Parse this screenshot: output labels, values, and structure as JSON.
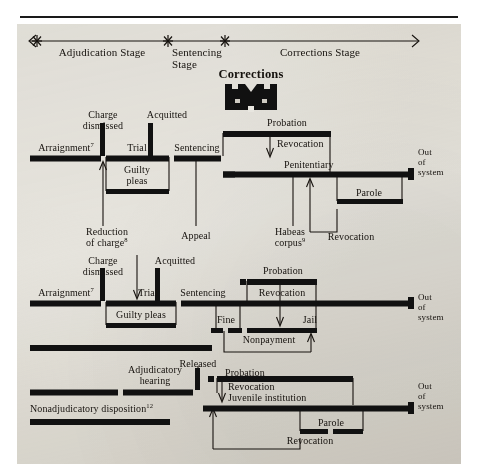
{
  "figure": {
    "icon_label": "Corrections",
    "icon_name": "fortress-corrections-icon",
    "colors": {
      "ink": "#16120e",
      "bar": "#111111",
      "paper": "#e8e6e0"
    }
  },
  "timeline": {
    "name": "stage-timeline",
    "stages": [
      {
        "label": "Adjudication Stage"
      },
      {
        "label": "Sentencing Stage"
      },
      {
        "label": "Corrections Stage"
      }
    ],
    "tick_marker": "asterisk"
  },
  "rows": [
    {
      "name": "adult-felony-track",
      "out_of_system": "Out of system",
      "labels": [
        {
          "text": "Arraignment",
          "note": "7"
        },
        {
          "text": "Charge dismissed",
          "note": ""
        },
        {
          "text": "Acquitted",
          "note": ""
        },
        {
          "text": "Trial",
          "note": ""
        },
        {
          "text": "Guilty pleas",
          "note": ""
        },
        {
          "text": "Sentencing",
          "note": ""
        },
        {
          "text": "Reduction of charge",
          "note": "8"
        },
        {
          "text": "Appeal",
          "note": ""
        },
        {
          "text": "Probation",
          "note": ""
        },
        {
          "text": "Revocation",
          "note": ""
        },
        {
          "text": "Penitentiary",
          "note": ""
        },
        {
          "text": "Parole",
          "note": ""
        },
        {
          "text": "Revocation",
          "note": ""
        },
        {
          "text": "Habeas corpus",
          "note": "9"
        }
      ]
    },
    {
      "name": "adult-misdemeanor-track",
      "out_of_system": "Out of system",
      "labels": [
        {
          "text": "Arraignment",
          "note": "7"
        },
        {
          "text": "Charge dismissed",
          "note": ""
        },
        {
          "text": "Acquitted",
          "note": ""
        },
        {
          "text": "Trial",
          "note": ""
        },
        {
          "text": "Guilty pleas",
          "note": ""
        },
        {
          "text": "Sentencing",
          "note": ""
        },
        {
          "text": "Probation",
          "note": ""
        },
        {
          "text": "Revocation",
          "note": ""
        },
        {
          "text": "Fine",
          "note": ""
        },
        {
          "text": "Jail",
          "note": ""
        },
        {
          "text": "Nonpayment",
          "note": ""
        }
      ]
    },
    {
      "name": "juvenile-track",
      "out_of_system": "Out of system",
      "labels": [
        {
          "text": "Adjudicatory hearing",
          "note": ""
        },
        {
          "text": "Released",
          "note": ""
        },
        {
          "text": "Nonadjudicatory disposition",
          "note": "12"
        },
        {
          "text": "Probation",
          "note": ""
        },
        {
          "text": "Revocation",
          "note": ""
        },
        {
          "text": "Juvenile institution",
          "note": ""
        },
        {
          "text": "Parole",
          "note": ""
        },
        {
          "text": "Revocation",
          "note": ""
        }
      ]
    }
  ],
  "text": {
    "stage_adjudication": "Adjudication Stage",
    "stage_sentencing_l1": "Sentencing",
    "stage_sentencing_l2": "Stage",
    "stage_corrections": "Corrections Stage",
    "corrections_icon_title": "Corrections",
    "r1_arraignment": "Arraignment",
    "r1_arraignment_note": "7",
    "r1_charge_l1": "Charge",
    "r1_charge_l2": "dismissed",
    "r1_acquitted": "Acquitted",
    "r1_trial": "Trial",
    "r1_guilty_l1": "Guilty",
    "r1_guilty_l2": "pleas",
    "r1_sentencing": "Sentencing",
    "r1_reduction_l1": "Reduction",
    "r1_reduction_l2": "of charge",
    "r1_reduction_note": "8",
    "r1_appeal": "Appeal",
    "r1_probation": "Probation",
    "r1_revocation": "Revocation",
    "r1_penitentiary": "Penitentiary",
    "r1_parole": "Parole",
    "r1_revocation2": "Revocation",
    "r1_habeas_l1": "Habeas",
    "r1_habeas_l2": "corpus",
    "r1_habeas_note": "9",
    "r1_out_l1": "Out",
    "r1_out_l2": "of",
    "r1_out_l3": "system",
    "r2_arraignment": "Arraignment",
    "r2_arraignment_note": "7",
    "r2_charge_l1": "Charge",
    "r2_charge_l2": "dismissed",
    "r2_acquitted": "Acquitted",
    "r2_trial": "Trial",
    "r2_guilty": "Guilty  pleas",
    "r2_sentencing": "Sentencing",
    "r2_probation": "Probation",
    "r2_revocation": "Revocation",
    "r2_fine": "Fine",
    "r2_jail": "Jail",
    "r2_nonpayment": "Nonpayment",
    "r2_out_l1": "Out",
    "r2_out_l2": "of",
    "r2_out_l3": "system",
    "r3_adjudicatory_l1": "Adjudicatory",
    "r3_adjudicatory_l2": "hearing",
    "r3_released": "Released",
    "r3_nonadjudicatory": "Nonadjudicatory disposition",
    "r3_nonadjudicatory_note": "12",
    "r3_probation": "Probation",
    "r3_revocation": "Revocation",
    "r3_juvenile": "Juvenile institution",
    "r3_parole": "Parole",
    "r3_revocation2": "Revocation",
    "r3_out_l1": "Out",
    "r3_out_l2": "of",
    "r3_out_l3": "system"
  }
}
